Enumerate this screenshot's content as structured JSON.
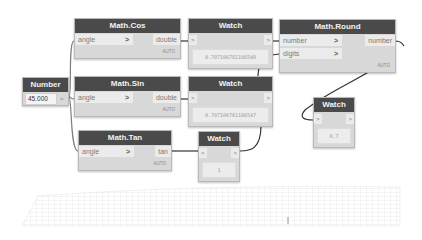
{
  "canvas": {
    "background": "#ffffff",
    "node_header_color": "#4a4a4a",
    "node_body_color": "#d8d8d8",
    "wire_color": "#7d7d7d",
    "wire_dark_color": "#333333"
  },
  "nodes": {
    "number": {
      "title": "Number",
      "value": "45.000",
      "out_port": ">"
    },
    "cos": {
      "title": "Math.Cos",
      "in_port": "angle",
      "chevron": ">",
      "out_port": "double",
      "lacing": "AUTO"
    },
    "sin": {
      "title": "Math.Sin",
      "in_port": "angle",
      "chevron": ">",
      "out_port": "double",
      "lacing": "AUTO"
    },
    "tan": {
      "title": "Math.Tan",
      "in_port": "angle",
      "chevron": ">",
      "out_port": "tan",
      "lacing": "AUTO"
    },
    "round": {
      "title": "Math.Round",
      "in_ports": [
        "number",
        "digits"
      ],
      "chevron": ">",
      "out_port": "number",
      "lacing": "AUTO"
    },
    "watch1": {
      "title": "Watch",
      "in_port": ">",
      "out_port": ">",
      "value": "0.707106781186548"
    },
    "watch2": {
      "title": "Watch",
      "in_port": ">",
      "out_port": ">",
      "value": "0.707106781186547"
    },
    "watch3": {
      "title": "Watch",
      "in_port": ">",
      "out_port": ">",
      "value": "0.7"
    },
    "watch4": {
      "title": "Watch",
      "in_port": ">",
      "out_port": ">",
      "value": "1"
    }
  }
}
